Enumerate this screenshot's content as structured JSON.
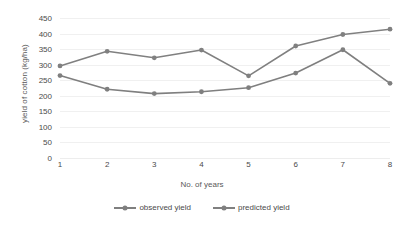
{
  "chart_data": {
    "type": "line",
    "title": "",
    "xlabel": "No. of years",
    "ylabel": "yield of cotton (kg/ha)",
    "categories": [
      "1",
      "2",
      "3",
      "4",
      "5",
      "6",
      "7",
      "8"
    ],
    "x": [
      1,
      2,
      3,
      4,
      5,
      6,
      7,
      8
    ],
    "xlim": [
      1,
      8
    ],
    "ylim": [
      0,
      450
    ],
    "y_ticks": [
      0,
      50,
      100,
      150,
      200,
      250,
      300,
      350,
      400,
      450
    ],
    "grid": "horizontal",
    "legend_position": "bottom",
    "series": [
      {
        "name": "observed yield",
        "color": "#7f7f7f",
        "marker": "circle",
        "values": [
          265,
          221,
          207,
          213,
          226,
          273,
          348,
          240
        ]
      },
      {
        "name": "predicted yield",
        "color": "#808080",
        "marker": "circle",
        "values": [
          296,
          343,
          322,
          347,
          264,
          360,
          397,
          414
        ]
      }
    ]
  },
  "legend": {
    "items": [
      {
        "label": "observed yield"
      },
      {
        "label": "predicted yield"
      }
    ]
  },
  "axes": {
    "y_title": "yield of cotton (kg/ha)",
    "x_title": "No. of years"
  }
}
